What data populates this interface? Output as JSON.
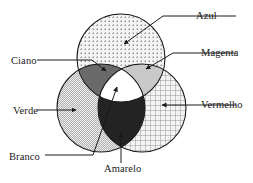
{
  "figure": {
    "type": "venn-diagram",
    "background_color": "#ffffff",
    "stroke_color": "#1a1a1a"
  },
  "labels": {
    "azul": "Azul",
    "magenta": "Magenta",
    "vermelho": "Vermelho",
    "ciano": "Ciano",
    "verde": "Verde",
    "branco": "Branco",
    "amarelo": "Amarelo"
  },
  "circles": [
    {
      "name": "azul",
      "label": "Azul",
      "cx": 121,
      "cy": 58,
      "r": 44,
      "fill_pattern": "fine-dots",
      "fill_color": "#f2f2f2",
      "pattern_color": "#7a7a7a"
    },
    {
      "name": "verde",
      "label": "Verde",
      "cx": 101,
      "cy": 108,
      "r": 44,
      "fill_pattern": "diagonal-hatch",
      "fill_color": "#ededed",
      "pattern_color": "#8c8c8c"
    },
    {
      "name": "vermelho",
      "label": "Vermelho",
      "cx": 142,
      "cy": 108,
      "r": 44,
      "fill_pattern": "grid",
      "fill_color": "#f2f2f2",
      "pattern_color": "#6e6e6e"
    }
  ],
  "overlaps": [
    {
      "name": "ciano",
      "label": "Ciano",
      "made_of": "azul + verde",
      "fill_color": "#6a6a6a"
    },
    {
      "name": "magenta",
      "label": "Magenta",
      "made_of": "azul + vermelho",
      "fill_color": "#c8c8c8"
    },
    {
      "name": "amarelo",
      "label": "Amarelo",
      "made_of": "verde + vermelho",
      "fill_color": "#232323"
    },
    {
      "name": "branco",
      "label": "Branco",
      "made_of": "azul + verde + vermelho",
      "fill_color": "#ffffff"
    }
  ],
  "leaders": [
    {
      "name": "azul-leader",
      "target": "azul",
      "label_side": "right"
    },
    {
      "name": "magenta-leader",
      "target": "magenta",
      "label_side": "right"
    },
    {
      "name": "vermelho-leader",
      "target": "vermelho",
      "label_side": "right"
    },
    {
      "name": "ciano-leader",
      "target": "ciano",
      "label_side": "left"
    },
    {
      "name": "verde-leader",
      "target": "verde",
      "label_side": "left"
    },
    {
      "name": "branco-leader",
      "target": "branco",
      "label_side": "left"
    },
    {
      "name": "amarelo-leader",
      "target": "amarelo",
      "label_side": "bottom"
    }
  ]
}
